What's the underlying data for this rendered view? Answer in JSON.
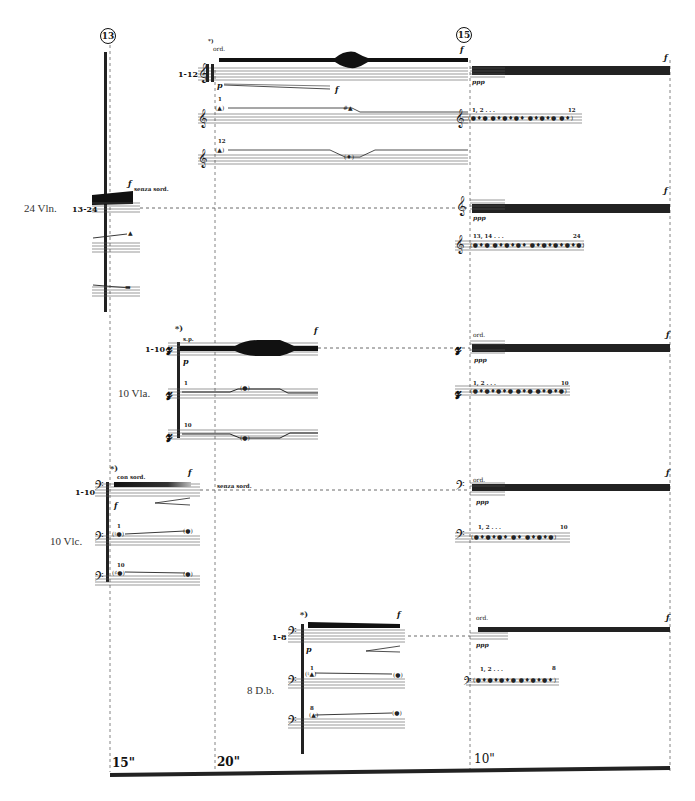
{
  "score": {
    "rehearsal_marks": [
      {
        "label": "13",
        "x": 108
      },
      {
        "label": "15",
        "x": 464
      }
    ],
    "time_markers": [
      {
        "label": "15\"",
        "x": 112
      },
      {
        "label": "20\"",
        "x": 217
      },
      {
        "label": "10\"",
        "x": 474
      }
    ],
    "footnote_marks": {
      "violins": "*)",
      "violas": "*)",
      "cellos": "*)",
      "basses": "*)"
    },
    "sections": {
      "violins": {
        "label": "24 Vln.",
        "group_a": "1-12",
        "group_b": "13-24",
        "technique_start": "ord.",
        "technique_mute": "senza sord.",
        "dynamics": {
          "start": "p",
          "end": "f",
          "sustain": "ppp",
          "accent": "f"
        },
        "divisi_labels": {
          "first_start": "1",
          "first_end": "12",
          "second_start": "12"
        },
        "cluster_labels": {
          "upper": "1, 2 . . .",
          "upper_end": "12",
          "lower": "13, 14 . . .",
          "lower_end": "24"
        }
      },
      "violas": {
        "label": "10 Vla.",
        "group": "1-10",
        "technique_start": "s.p.",
        "technique_end": "ord.",
        "dynamics": {
          "start": "p",
          "sustain": "ppp",
          "accent": "f"
        },
        "divisi_labels": {
          "first": "1",
          "last": "10"
        },
        "cluster_labels": {
          "start": "1, 2 . . .",
          "end": "10"
        }
      },
      "cellos": {
        "label": "10 Vlc.",
        "group": "1-10",
        "technique_start": "con sord.",
        "technique_mute": "senza sord.",
        "technique_end": "ord.",
        "dynamics": {
          "start": "f",
          "sustain": "ppp",
          "accent": "f"
        },
        "divisi_labels": {
          "first": "1",
          "last": "10"
        },
        "cluster_labels": {
          "start": "1, 2 . . .",
          "end": "10"
        }
      },
      "basses": {
        "label": "8 D.b.",
        "group": "1-8",
        "technique_end": "ord.",
        "dynamics": {
          "start": "p",
          "sustain": "ppp",
          "accent": "f"
        },
        "divisi_labels": {
          "first": "1",
          "last": "8"
        },
        "cluster_labels": {
          "start": "1, 2 . . .",
          "end": "8"
        }
      }
    },
    "colors": {
      "ink": "#111111",
      "staff": "#555555",
      "paper": "#ffffff"
    }
  }
}
